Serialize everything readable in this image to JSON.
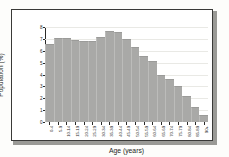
{
  "chart_data": {
    "type": "bar",
    "title": "",
    "xlabel": "Age (years)",
    "ylabel": "Population (%)",
    "ylim": [
      0,
      8
    ],
    "yticks": [
      0,
      1,
      2,
      3,
      4,
      5,
      6,
      7,
      8
    ],
    "grid": true,
    "legend": null,
    "bar_color": "#a9a9a7",
    "categories": [
      "0-4",
      "5-9",
      "10-14",
      "15-19",
      "20-24",
      "25-29",
      "30-34",
      "35-39",
      "40-44",
      "45-49",
      "50-54",
      "55-59",
      "60-64",
      "65-69",
      "70-74",
      "75-79",
      "80-84",
      "85-89",
      "90+"
    ],
    "values": [
      6.6,
      7.1,
      7.1,
      6.9,
      6.8,
      6.8,
      7.2,
      7.7,
      7.6,
      7.0,
      6.3,
      5.6,
      5.1,
      4.0,
      3.6,
      3.0,
      2.2,
      1.3,
      0.6
    ]
  },
  "figure": {
    "background": "#fdfdfb",
    "frame_border": "#3a3a38",
    "axis_color": "#2a2a28",
    "gridline_color": "#e9e9e5"
  }
}
